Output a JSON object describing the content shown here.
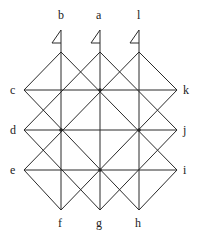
{
  "diagram": {
    "labels": {
      "a": "a",
      "b": "b",
      "c": "c",
      "d": "d",
      "e": "e",
      "f": "f",
      "g": "g",
      "h": "h",
      "i": "i",
      "j": "j",
      "k": "k",
      "l": "l"
    },
    "columns_x": [
      24,
      61,
      100,
      139,
      177
    ],
    "rows_y": [
      52,
      90,
      130,
      170,
      210
    ],
    "line_color": "#2a2a2a"
  }
}
